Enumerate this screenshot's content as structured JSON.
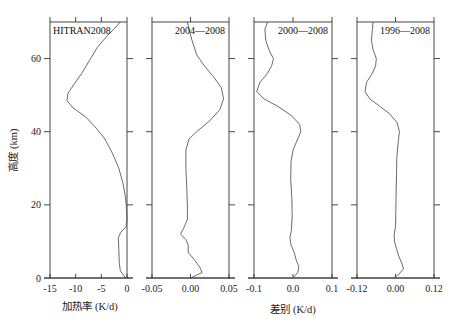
{
  "chart_data": [
    {
      "type": "line",
      "panel_label": "HITRAN2008",
      "xlabel": "加热率 (K/d)",
      "ylabel": "高度 (km)",
      "xlim": [
        -15,
        0
      ],
      "ylim": [
        0,
        70
      ],
      "x_ticks": [
        -15,
        -10,
        -5,
        0
      ],
      "x_tick_labels": [
        "-15",
        "-10",
        "-5",
        "0"
      ],
      "y_ticks": [
        0,
        20,
        40,
        60
      ],
      "y_tick_labels": [
        "0",
        "20",
        "40",
        "60"
      ],
      "series": [
        {
          "name": "HITRAN2008",
          "points": [
            [
              -0.3,
              0
            ],
            [
              -0.8,
              1
            ],
            [
              -1.3,
              2
            ],
            [
              -1.5,
              4
            ],
            [
              -1.6,
              8
            ],
            [
              -1.7,
              11
            ],
            [
              -1.2,
              12.5
            ],
            [
              -0.2,
              14
            ],
            [
              0,
              16
            ],
            [
              -0.1,
              19
            ],
            [
              -0.3,
              22
            ],
            [
              -0.8,
              26
            ],
            [
              -1.6,
              30
            ],
            [
              -2.8,
              34
            ],
            [
              -4.3,
              38
            ],
            [
              -6.0,
              41
            ],
            [
              -8.0,
              44
            ],
            [
              -10.5,
              46.5
            ],
            [
              -11.7,
              48.5
            ],
            [
              -11.5,
              50.5
            ],
            [
              -10.3,
              53
            ],
            [
              -8.8,
              56
            ],
            [
              -7.3,
              59.5
            ],
            [
              -5.8,
              63
            ],
            [
              -4.0,
              66
            ],
            [
              -2.6,
              68
            ],
            [
              -1.3,
              70
            ]
          ]
        }
      ]
    },
    {
      "type": "line",
      "panel_label": "2004—2008",
      "xlabel": "",
      "xlim": [
        -0.05,
        0.05
      ],
      "ylim": [
        0,
        70
      ],
      "x_ticks": [
        -0.05,
        0.0,
        0.05
      ],
      "x_tick_labels": [
        "-0.05",
        "0.00",
        "0.05"
      ],
      "series": [
        {
          "name": "2004—2008",
          "points": [
            [
              0.0,
              0
            ],
            [
              0.008,
              0.8
            ],
            [
              0.015,
              1.5
            ],
            [
              0.012,
              3
            ],
            [
              0.005,
              5
            ],
            [
              -0.003,
              7
            ],
            [
              -0.003,
              9
            ],
            [
              -0.006,
              10.5
            ],
            [
              -0.013,
              12
            ],
            [
              -0.008,
              14
            ],
            [
              -0.004,
              16
            ],
            [
              -0.004,
              20
            ],
            [
              -0.005,
              25
            ],
            [
              -0.006,
              30
            ],
            [
              -0.006,
              35
            ],
            [
              -0.002,
              38
            ],
            [
              0.008,
              40
            ],
            [
              0.025,
              43
            ],
            [
              0.038,
              46
            ],
            [
              0.043,
              49
            ],
            [
              0.04,
              52
            ],
            [
              0.03,
              55
            ],
            [
              0.018,
              58
            ],
            [
              0.008,
              61
            ],
            [
              0.002,
              65
            ],
            [
              -0.002,
              68
            ],
            [
              -0.004,
              70
            ]
          ]
        }
      ]
    },
    {
      "type": "line",
      "panel_label": "2000—2008",
      "xlabel": "差别 (K/d)",
      "xlim": [
        -0.1,
        0.1
      ],
      "ylim": [
        0,
        70
      ],
      "x_ticks": [
        -0.1,
        0.0,
        0.1
      ],
      "x_tick_labels": [
        "-0.1",
        "0.0",
        "0.1"
      ],
      "series": [
        {
          "name": "2000—2008",
          "points": [
            [
              0.0,
              0
            ],
            [
              0.012,
              1.5
            ],
            [
              0.015,
              3
            ],
            [
              0.008,
              5
            ],
            [
              0.003,
              7
            ],
            [
              -0.005,
              9
            ],
            [
              -0.008,
              11
            ],
            [
              -0.004,
              13
            ],
            [
              -0.002,
              17
            ],
            [
              -0.003,
              22
            ],
            [
              -0.006,
              27
            ],
            [
              -0.005,
              32
            ],
            [
              0.0,
              35
            ],
            [
              0.012,
              38
            ],
            [
              0.02,
              40
            ],
            [
              0.017,
              42
            ],
            [
              -0.005,
              44.5
            ],
            [
              -0.04,
              47
            ],
            [
              -0.075,
              49
            ],
            [
              -0.093,
              51
            ],
            [
              -0.085,
              53.5
            ],
            [
              -0.065,
              56
            ],
            [
              -0.055,
              58
            ],
            [
              -0.05,
              60
            ],
            [
              -0.06,
              62
            ],
            [
              -0.07,
              65
            ],
            [
              -0.072,
              68
            ],
            [
              -0.065,
              70
            ]
          ]
        }
      ]
    },
    {
      "type": "line",
      "panel_label": "1996—2008",
      "xlabel": "",
      "xlim": [
        -0.12,
        0.12
      ],
      "ylim": [
        0,
        70
      ],
      "x_ticks": [
        -0.12,
        0.0,
        0.12
      ],
      "x_tick_labels": [
        "-0.12",
        "0.00",
        "0.12"
      ],
      "series": [
        {
          "name": "1996—2008",
          "points": [
            [
              -0.003,
              0
            ],
            [
              0.01,
              1
            ],
            [
              0.025,
              2.5
            ],
            [
              0.02,
              4
            ],
            [
              0.01,
              6
            ],
            [
              0.003,
              8
            ],
            [
              -0.003,
              10
            ],
            [
              -0.004,
              12
            ],
            [
              0.0,
              14
            ],
            [
              0.001,
              18
            ],
            [
              0.002,
              23
            ],
            [
              0.003,
              28
            ],
            [
              0.004,
              33
            ],
            [
              0.008,
              37
            ],
            [
              0.012,
              40
            ],
            [
              0.005,
              42.5
            ],
            [
              -0.02,
              45
            ],
            [
              -0.05,
              47
            ],
            [
              -0.08,
              49
            ],
            [
              -0.095,
              51
            ],
            [
              -0.09,
              53.5
            ],
            [
              -0.072,
              56
            ],
            [
              -0.062,
              58
            ],
            [
              -0.06,
              60
            ],
            [
              -0.07,
              62.5
            ],
            [
              -0.075,
              65
            ],
            [
              -0.072,
              68
            ],
            [
              -0.07,
              70
            ]
          ]
        }
      ]
    }
  ],
  "figure": {
    "ylabel": "高度 (km)",
    "xlabel_left": "加热率 (K/d)",
    "xlabel_right": "差别 (K/d)"
  }
}
